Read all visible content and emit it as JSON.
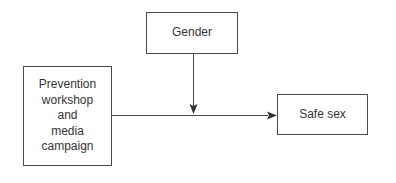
{
  "diagram": {
    "type": "moderation-model",
    "nodes": [
      {
        "id": "gender",
        "label": "Gender",
        "lines": [
          "Gender"
        ],
        "role": "moderator"
      },
      {
        "id": "prevention",
        "label": "Prevention workshop and media campaign",
        "lines": [
          "Prevention",
          "workshop",
          "and",
          "media",
          "campaign"
        ],
        "role": "independent-variable"
      },
      {
        "id": "safesex",
        "label": "Safe sex",
        "lines": [
          "Safe sex"
        ],
        "role": "dependent-variable"
      }
    ],
    "edges": [
      {
        "from": "prevention",
        "to": "safesex",
        "style": "solid-arrow"
      },
      {
        "from": "gender",
        "to": "prevention->safesex",
        "style": "solid-arrow"
      }
    ],
    "colors": {
      "line": "#4a4a4a",
      "text": "#333333",
      "background": "#ffffff"
    }
  }
}
